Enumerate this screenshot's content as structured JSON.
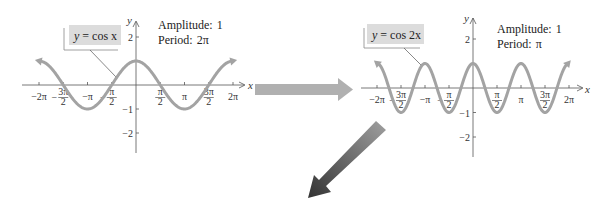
{
  "panels": [
    {
      "id": "left",
      "equation_var": "y",
      "equation_rhs": "= cos x",
      "amplitude_label": "Amplitude:",
      "amplitude_value": "1",
      "period_label": "Period:",
      "period_value": "2π",
      "x_axis_label": "x",
      "y_axis_label": "y",
      "x_ticks": [
        "−2π",
        "−3π/2",
        "−π",
        "−π/2",
        "π/2",
        "π",
        "3π/2",
        "2π"
      ],
      "y_ticks": [
        "2",
        "−1",
        "−2"
      ],
      "frequency": 1
    },
    {
      "id": "right",
      "equation_var": "y",
      "equation_rhs": "= cos 2x",
      "amplitude_label": "Amplitude:",
      "amplitude_value": "1",
      "period_label": "Period:",
      "period_value": "π",
      "x_axis_label": "x",
      "y_axis_label": "y",
      "x_ticks": [
        "−2π",
        "−3π/2",
        "−π",
        "−π/2",
        "π/2",
        "π",
        "3π/2",
        "2π"
      ],
      "y_ticks": [
        "2",
        "−1",
        "−2"
      ],
      "frequency": 2
    }
  ],
  "colors": {
    "curve": "#a3a3a3",
    "axis": "#555555",
    "label_box": "#dcdcdc",
    "arrow_right": "#b0b0b0",
    "arrow_diag_start": "#9a9a9a",
    "arrow_diag_end": "#3a3a3a"
  },
  "arrows": [
    {
      "name": "transform-arrow-right",
      "direction": "right"
    },
    {
      "name": "transform-arrow-down-left",
      "direction": "down-left"
    }
  ]
}
